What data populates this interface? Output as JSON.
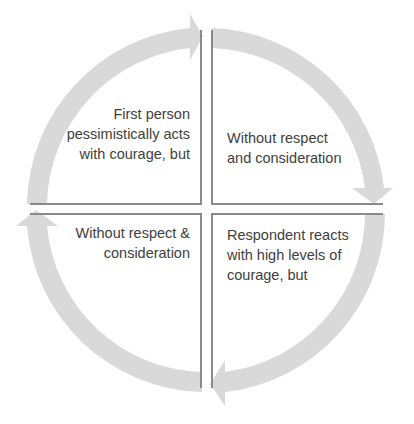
{
  "diagram": {
    "type": "cycle",
    "arrow_color": "#d9d9d9",
    "divider_color": "#8a8a8a",
    "text_color": "#404040",
    "quadrants": {
      "top_left": {
        "label": "First person pessimistically acts with courage, but",
        "lines": [
          "First person",
          "pessimistically acts",
          "with courage, but"
        ]
      },
      "top_right": {
        "label": "Without respect and consideration",
        "lines": [
          "Without respect",
          "and consideration"
        ]
      },
      "bottom_right": {
        "label": "Respondent reacts with high levels of courage, but",
        "lines": [
          "Respondent reacts",
          "with high levels of",
          "courage, but"
        ]
      },
      "bottom_left": {
        "label": "Without respect & consideration",
        "lines": [
          "Without respect &",
          "consideration"
        ]
      }
    },
    "flow": [
      "top_left",
      "top_right",
      "bottom_right",
      "bottom_left"
    ],
    "direction": "clockwise"
  }
}
